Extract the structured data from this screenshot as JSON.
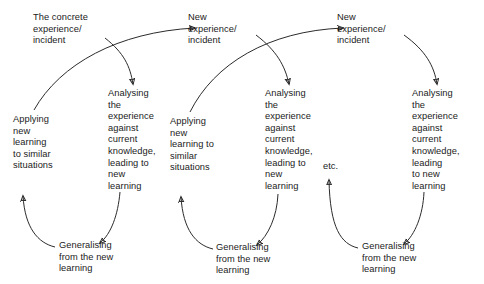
{
  "diagram": {
    "type": "cycle-flow-diagram",
    "background_color": "#ffffff",
    "stroke_color": "#2b2b2b",
    "text_color": "#1b1b1b",
    "cycles": [
      {
        "index": 1,
        "trigger": "The concrete\nexperience/\nincident",
        "analysing": "Analysing\nthe\nexperience\nagainst\ncurrent\nknowledge,\nleading to\nnew\nlearning",
        "generalising": "Generalising\nfrom the new\nlearning",
        "applying": "Applying\nnew\nlearning\nto similar\nsituations"
      },
      {
        "index": 2,
        "trigger": "New\nexperience/\nincident",
        "analysing": "Analysing\nthe\nexperience\nagainst\ncurrent\nknowledge,\nleading to\nnew\nlearning",
        "generalising": "Generalising\nfrom the new\nlearning",
        "applying": "Applying\nnew\nlearning to\nsimilar\nsituations"
      },
      {
        "index": 3,
        "trigger": "New\nexperience/\nincident",
        "analysing": "Analysing\nthe\nexperience\nagainst\ncurrent\nknowledge,\nleading\nto new\nlearning",
        "generalising": "Generalising\nfrom the new\nlearning",
        "applying": null
      }
    ],
    "continuation_label": "etc."
  }
}
